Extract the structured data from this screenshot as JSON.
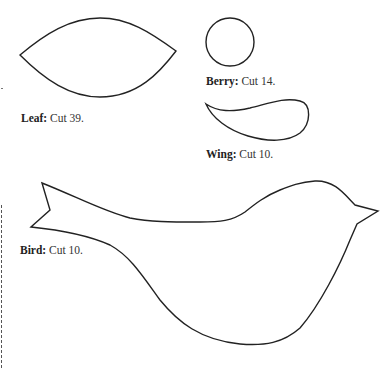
{
  "pieces": [
    {
      "id": "leaf",
      "name": "Leaf:",
      "instruction": "Cut 39."
    },
    {
      "id": "berry",
      "name": "Berry:",
      "instruction": "Cut 14."
    },
    {
      "id": "wing",
      "name": "Wing:",
      "instruction": "Cut 10."
    },
    {
      "id": "bird",
      "name": "Bird:",
      "instruction": "Cut 10."
    }
  ],
  "style": {
    "outline_color": "#222222",
    "dashed_fold_line_color": "#555555",
    "background": "#ffffff"
  }
}
